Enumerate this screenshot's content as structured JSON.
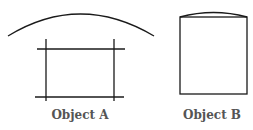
{
  "objects": [
    {
      "id": "A",
      "label": "Object A"
    },
    {
      "id": "B",
      "label": "Object B"
    }
  ],
  "colors": {
    "stroke": "#1a1a1a",
    "label": "#555555",
    "background": "#ffffff"
  }
}
